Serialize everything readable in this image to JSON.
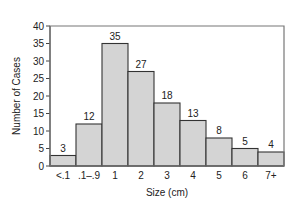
{
  "chart_data": {
    "type": "bar",
    "title": "",
    "xlabel": "Size (cm)",
    "ylabel": "Number of Cases",
    "categories": [
      "<.1",
      ".1–.9",
      "1",
      "2",
      "3",
      "4",
      "5",
      "6",
      "7+"
    ],
    "values": [
      3,
      12,
      35,
      27,
      18,
      13,
      8,
      5,
      4
    ],
    "ylim": [
      0,
      40
    ],
    "yticks": [
      0,
      5,
      10,
      15,
      20,
      25,
      30,
      35,
      40
    ],
    "grid": false,
    "legend": null,
    "data_labels": true,
    "bar_color": "#d4d4d4",
    "edge_color": "#333333"
  }
}
